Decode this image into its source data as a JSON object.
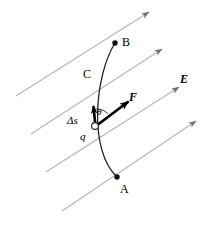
{
  "figure": {
    "width": 209,
    "height": 232,
    "background_color": "#ffffff",
    "field_line_color": "#b0b0b0",
    "path_color": "#1a1a1a",
    "vector_color": "#000000"
  },
  "labels": {
    "point_a": "A",
    "point_b": "B",
    "path_c": "C",
    "field_e": "E",
    "force_f": "F",
    "displacement": "Δs",
    "charge_q": "q",
    "angle_theta": "θ"
  },
  "label_positions": {
    "point_a": {
      "x": 120,
      "y": 183
    },
    "point_b": {
      "x": 122,
      "y": 36
    },
    "path_c": {
      "x": 83,
      "y": 68
    },
    "field_e": {
      "x": 180,
      "y": 73
    },
    "force_f": {
      "x": 129,
      "y": 91
    },
    "displacement": {
      "x": 67,
      "y": 115
    },
    "charge_q": {
      "x": 80,
      "y": 131
    },
    "angle_theta": {
      "x": 97,
      "y": 108
    }
  },
  "geometry": {
    "field_lines": [
      {
        "name": "field-line-1",
        "x1": 16,
        "y1": 96,
        "x2": 149,
        "y2": 12
      },
      {
        "name": "field-line-2",
        "x1": 31,
        "y1": 134,
        "x2": 162,
        "y2": 49
      },
      {
        "name": "field-line-3",
        "x1": 46,
        "y1": 172,
        "x2": 179,
        "y2": 87
      },
      {
        "name": "field-line-4",
        "x1": 62,
        "y1": 211,
        "x2": 196,
        "y2": 121
      }
    ],
    "trajectory": {
      "name": "trajectory-curve",
      "start": {
        "x": 117,
        "y": 177
      },
      "control_1": {
        "x": 88,
        "y": 150
      },
      "control_2": {
        "x": 95,
        "y": 75
      },
      "end": {
        "x": 115,
        "y": 43
      }
    },
    "point_a_marker": {
      "x": 117,
      "y": 177,
      "r": 2.6
    },
    "point_b_marker": {
      "x": 115,
      "y": 43,
      "r": 2.6
    },
    "charge_marker": {
      "x": 95,
      "y": 126,
      "r": 3.2
    },
    "displacement_vector": {
      "x1": 95,
      "y": 104,
      "x2": 93
    },
    "force_vector": {
      "x1": 95,
      "y": 126,
      "x2": 131,
      "y2": 99
    },
    "angle_arc": {
      "cx": 95,
      "cy": 126,
      "r": 17
    }
  },
  "physics": {
    "description": "A charge q travels along curved path C from point A to point B within a uniform electric field E. The force F on the charge makes an angle theta with the infinitesimal displacement element delta-s along the path.",
    "field_direction": "up and to the right",
    "force_direction": "up and to the right, parallel to E",
    "displacement_direction": "tangent to path C, upward"
  }
}
